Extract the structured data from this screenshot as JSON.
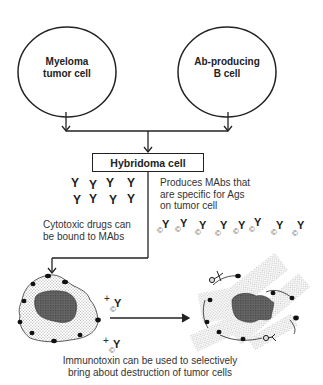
{
  "diagram": {
    "nodes": {
      "myeloma": {
        "label_line1": "Myeloma",
        "label_line2": "tumor cell"
      },
      "b_cell": {
        "label_line1": "Ab-producing",
        "label_line2": "B cell"
      },
      "hybridoma": {
        "label": "Hybridoma cell"
      }
    },
    "notes": {
      "produces": [
        "Produces MAbs that",
        "are specific for Ags",
        "on tumor cell"
      ],
      "cytotoxic": [
        "Cytotoxic drugs can",
        "be bound to MAbs"
      ],
      "immunotoxin": [
        "Immunotoxin can be used to selectively",
        "bring about destruction of tumor cells"
      ]
    },
    "symbols": {
      "antibody": "Y",
      "drug_marker": "©",
      "plus": "+"
    },
    "antibody_grid_count": 8,
    "drug_conjugate_count": 8,
    "cells": {
      "intact_tumor_cell": "intact tumor cell with antigens",
      "destroyed_tumor_cell": "lysed tumor cell with bound immunotoxin"
    },
    "colors": {
      "line": "#222222",
      "text": "#2a2a2a",
      "stipple": "#9a9a9a",
      "nucleus": "#555555"
    }
  }
}
